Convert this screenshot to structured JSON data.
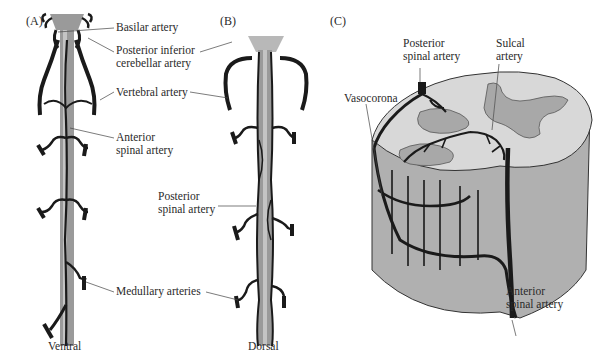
{
  "figure": {
    "colors": {
      "vessel": "#1a1a1a",
      "cord": "#9a9a9a",
      "cord_light": "#c4c4c4",
      "white_matter": "#d8d8d8",
      "gray_matter": "#a8a8a8",
      "cylinder_side": "#b0b0b0",
      "leader": "#444444"
    },
    "panels": [
      {
        "id": "A",
        "label": "(A)",
        "view_label": "Ventral",
        "annotations": [
          {
            "text": "Basilar artery"
          },
          {
            "text": "Posterior inferior\ncerebellar artery"
          },
          {
            "text": "Vertebral artery"
          },
          {
            "text": "Anterior\nspinal artery"
          },
          {
            "text": "Medullary arteries"
          }
        ]
      },
      {
        "id": "B",
        "label": "(B)",
        "view_label": "Dorsal",
        "annotations": [
          {
            "text": "Posterior\nspinal artery"
          }
        ]
      },
      {
        "id": "C",
        "label": "(C)",
        "annotations": [
          {
            "text": "Posterior\nspinal artery"
          },
          {
            "text": "Sulcal\nartery"
          },
          {
            "text": "Vasocorona"
          },
          {
            "text": "Anterior\nspinal artery"
          }
        ]
      }
    ]
  }
}
